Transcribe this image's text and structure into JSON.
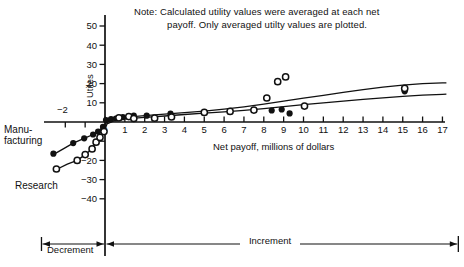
{
  "page": {
    "background": "#ffffff",
    "ink": "#111111"
  },
  "chart_data": {
    "type": "scatter",
    "note": {
      "line1": "Note: Calculated utility values were averaged at each net",
      "line2": "payoff. Only averaged utilty values are plotted."
    },
    "xlabel": "Net payoff, millions of dollars",
    "ylabel": "Utiles",
    "x_range": [
      -3.2,
      17.3
    ],
    "y_range": [
      -45,
      55
    ],
    "grid": "off",
    "x_ticks": [
      {
        "v": -2,
        "label": "−2",
        "pos": "above"
      },
      {
        "v": -1,
        "label": "",
        "pos": "above"
      },
      {
        "v": 0,
        "label": "0",
        "pos": "below"
      },
      {
        "v": 1,
        "label": "1",
        "pos": "below"
      },
      {
        "v": 2,
        "label": "2",
        "pos": "below"
      },
      {
        "v": 3,
        "label": "3",
        "pos": "below"
      },
      {
        "v": 4,
        "label": "4",
        "pos": "below"
      },
      {
        "v": 5,
        "label": "5",
        "pos": "below"
      },
      {
        "v": 6,
        "label": "6",
        "pos": "below"
      },
      {
        "v": 7,
        "label": "7",
        "pos": "below"
      },
      {
        "v": 8,
        "label": "8",
        "pos": "below"
      },
      {
        "v": 9,
        "label": "9",
        "pos": "below"
      },
      {
        "v": 10,
        "label": "10",
        "pos": "below"
      },
      {
        "v": 11,
        "label": "11",
        "pos": "below"
      },
      {
        "v": 12,
        "label": "12",
        "pos": "below"
      },
      {
        "v": 13,
        "label": "13",
        "pos": "below"
      },
      {
        "v": 14,
        "label": "14",
        "pos": "below"
      },
      {
        "v": 15,
        "label": "15",
        "pos": "below"
      },
      {
        "v": 16,
        "label": "16",
        "pos": "below"
      },
      {
        "v": 17,
        "label": "17",
        "pos": "below"
      }
    ],
    "y_ticks": [
      {
        "v": 50,
        "label": "50"
      },
      {
        "v": 40,
        "label": "40"
      },
      {
        "v": 30,
        "label": "30"
      },
      {
        "v": 20,
        "label": "20"
      },
      {
        "v": 10,
        "label": "10"
      },
      {
        "v": -10,
        "label": ""
      },
      {
        "v": -20,
        "label": "−20"
      },
      {
        "v": -30,
        "label": "−30"
      },
      {
        "v": -40,
        "label": "−40"
      }
    ],
    "series": [
      {
        "name": "Manufacturing",
        "label_line1": "Manu-",
        "label_line2": "facturing",
        "marker": "filled",
        "points": [
          [
            -2.6,
            -16.5
          ],
          [
            -1.6,
            -11
          ],
          [
            -1.05,
            -8.5
          ],
          [
            -0.6,
            -6.5
          ],
          [
            -0.35,
            -5
          ],
          [
            -0.1,
            -2.5
          ],
          [
            0.05,
            1.0
          ],
          [
            0.3,
            1.5
          ],
          [
            0.55,
            1.8
          ],
          [
            0.9,
            2.5
          ],
          [
            1.45,
            3.3
          ],
          [
            2.1,
            3.3
          ],
          [
            3.3,
            4.3
          ],
          [
            8.4,
            6.0
          ],
          [
            8.9,
            6.5
          ],
          [
            9.3,
            4.5
          ],
          [
            15.1,
            16.0
          ]
        ]
      },
      {
        "name": "Research",
        "label": "Research",
        "marker": "open",
        "points": [
          [
            -2.45,
            -24.5
          ],
          [
            -1.4,
            -20
          ],
          [
            -1.0,
            -17
          ],
          [
            -0.65,
            -14
          ],
          [
            -0.45,
            -10.5
          ],
          [
            -0.25,
            -8
          ],
          [
            -0.05,
            -5
          ],
          [
            0.7,
            2.2
          ],
          [
            1.2,
            2.8
          ],
          [
            1.45,
            1.8
          ],
          [
            2.5,
            2.0
          ],
          [
            3.35,
            2.6
          ],
          [
            5.0,
            5.0
          ],
          [
            6.3,
            5.5
          ],
          [
            7.5,
            6.2
          ],
          [
            8.15,
            12.5
          ],
          [
            8.7,
            21.0
          ],
          [
            9.1,
            23.5
          ],
          [
            10.05,
            8.3
          ],
          [
            15.1,
            17.5
          ]
        ]
      }
    ],
    "fitted_curves": [
      {
        "name": "upper-fit",
        "points": [
          [
            -2.7,
            -17.5
          ],
          [
            -2.1,
            -14
          ],
          [
            -1.6,
            -11
          ],
          [
            -1.05,
            -8.5
          ],
          [
            -0.6,
            -6.5
          ],
          [
            -0.3,
            -4.5
          ],
          [
            -0.1,
            -2.5
          ],
          [
            0.1,
            0
          ],
          [
            0.5,
            1.5
          ],
          [
            1,
            2.4
          ],
          [
            2,
            3.3
          ],
          [
            3,
            4.1
          ],
          [
            4,
            4.9
          ],
          [
            5,
            5.7
          ],
          [
            6,
            6.7
          ],
          [
            7,
            7.9
          ],
          [
            8,
            9.3
          ],
          [
            9,
            10.9
          ],
          [
            10,
            12.4
          ],
          [
            11,
            13.9
          ],
          [
            12,
            15.4
          ],
          [
            13,
            16.9
          ],
          [
            14,
            18.2
          ],
          [
            15,
            19.2
          ],
          [
            16,
            20.0
          ],
          [
            17,
            20.4
          ],
          [
            17.2,
            20.4
          ]
        ]
      },
      {
        "name": "lower-fit",
        "points": [
          [
            -2.5,
            -25
          ],
          [
            -1.9,
            -22
          ],
          [
            -1.4,
            -20
          ],
          [
            -1.0,
            -17
          ],
          [
            -0.65,
            -14
          ],
          [
            -0.45,
            -10.5
          ],
          [
            -0.25,
            -8
          ],
          [
            -0.05,
            -5
          ],
          [
            0.1,
            -1
          ],
          [
            0.5,
            0.8
          ],
          [
            1,
            1.6
          ],
          [
            2,
            2.4
          ],
          [
            3,
            3.1
          ],
          [
            4,
            3.9
          ],
          [
            5,
            4.6
          ],
          [
            6,
            5.3
          ],
          [
            7,
            6.1
          ],
          [
            8,
            7.0
          ],
          [
            9,
            8.0
          ],
          [
            10,
            9.0
          ],
          [
            11,
            10.0
          ],
          [
            12,
            10.9
          ],
          [
            13,
            11.8
          ],
          [
            14,
            12.6
          ],
          [
            15,
            13.4
          ],
          [
            16,
            14.0
          ],
          [
            17,
            14.4
          ],
          [
            17.2,
            14.5
          ]
        ]
      }
    ],
    "range_annotations": [
      {
        "label": "Decrement",
        "from": -3.2,
        "to": 0
      },
      {
        "label": "Increment",
        "from": 0,
        "to": 17.8
      }
    ]
  }
}
